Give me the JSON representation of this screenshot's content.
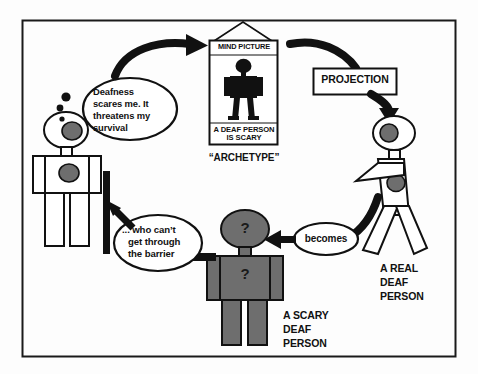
{
  "figure": {
    "border_color": "#1a1a1a",
    "background_color": "#fdfdfd",
    "ink_color": "#111111",
    "gray_fill": "#6e6e6e",
    "outline_fill": "#ffffff"
  },
  "mind_picture": {
    "header_label": "MIND PICTURE",
    "caption_line1": "A DEAF PERSON",
    "caption_line2": "IS SCARY",
    "below_label": "“ARCHETYPE”"
  },
  "labels": {
    "projection": "PROJECTION",
    "becomes": "becomes",
    "real_deaf_person": [
      "A REAL",
      "DEAF",
      "PERSON"
    ],
    "scary_deaf_person": [
      "A SCARY",
      "DEAF",
      "PERSON"
    ],
    "question_mark": "?"
  },
  "thought_bubble": {
    "lines": [
      "Deafness",
      "scares me. It",
      "threatens my",
      "survival"
    ]
  },
  "speech_bubble": {
    "lines": [
      "... who can’t",
      "get through",
      "the barrier"
    ]
  },
  "flow": {
    "steps": [
      "Observer thinks: Deafness scares me. It threatens my survival",
      "Thought forms the MIND PICTURE archetype: A DEAF PERSON IS SCARY",
      "PROJECTION casts the archetype onto a real deaf person",
      "A real deaf person becomes a scary deaf person",
      "The scary deaf person cannot get through the barrier back to the observer"
    ]
  }
}
